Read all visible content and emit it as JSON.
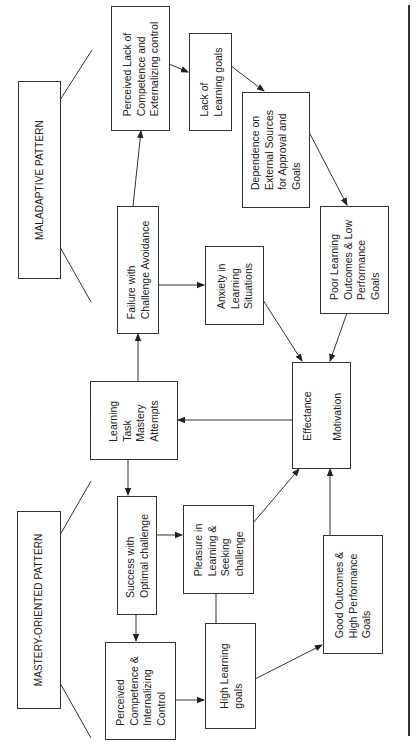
{
  "diagram": {
    "orientation": "rotated-90-ccw",
    "patterns": {
      "maladaptive": "MALADAPTIVE PATTERN",
      "mastery": "MASTERY-ORIENTED PATTERN"
    },
    "nodes": {
      "learning_task": "Learning\nTask\nMastery\nAttempts",
      "effectance": "Effectance\nMotivation",
      "failure": "Failure with\nChallenge Avoidance",
      "perceived_lack": "Perceived Lack of\nCompetence and\nExternalizing control",
      "lack_goals": "Lack of\nLearning goals",
      "dependence": "Dependence on\nExternal Sources\nfor Approval and\nGoals",
      "poor_outcomes": "Poor Learning\nOutcomes & Low\nPerformance\nGoals",
      "anxiety": "Anxiety in\nLearning\nSituations",
      "success": "Success with\nOptimal challenge",
      "pleasure": "Pleasure in\nLearning &\nSeeking\nchallenge",
      "perceived_competence": "Perceived\nCompetence &\nInternalizing\nControl",
      "high_goals": "High Learning\ngoals",
      "good_outcomes": "Good Outcomes &\nHigh Performance\nGoals"
    },
    "edges": [
      {
        "from": "learning_task",
        "to": "failure"
      },
      {
        "from": "learning_task",
        "to": "success"
      },
      {
        "from": "effectance",
        "to": "learning_task"
      },
      {
        "from": "failure",
        "to": "perceived_lack"
      },
      {
        "from": "failure",
        "to": "anxiety"
      },
      {
        "from": "perceived_lack",
        "to": "lack_goals"
      },
      {
        "from": "lack_goals",
        "to": "dependence"
      },
      {
        "from": "dependence",
        "to": "poor_outcomes"
      },
      {
        "from": "anxiety",
        "to": "effectance"
      },
      {
        "from": "poor_outcomes",
        "to": "effectance"
      },
      {
        "from": "success",
        "to": "pleasure"
      },
      {
        "from": "success",
        "to": "perceived_competence"
      },
      {
        "from": "perceived_competence",
        "to": "high_goals"
      },
      {
        "from": "pleasure",
        "to": "high_goals",
        "style": "line"
      },
      {
        "from": "pleasure",
        "to": "effectance"
      },
      {
        "from": "high_goals",
        "to": "good_outcomes"
      },
      {
        "from": "good_outcomes",
        "to": "effectance"
      }
    ],
    "colors": {
      "line": "#333333",
      "background": "#ffffff",
      "text": "#222222"
    }
  }
}
